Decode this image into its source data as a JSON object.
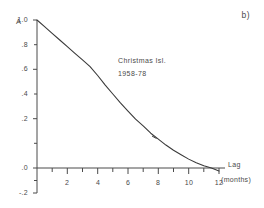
{
  "panel": {
    "label": "b)"
  },
  "annotation": {
    "line1": "Christmas Isl.",
    "line2": "1958-78"
  },
  "axes": {
    "y_symbol": "A",
    "x_title": "Lag",
    "x_units": "(months)",
    "y_ticks": [
      "1.0",
      ".8",
      ".6",
      ".4",
      ".2",
      ".0",
      "-.2"
    ],
    "x_ticks": [
      "2",
      "4",
      "6",
      "8",
      "10",
      "12"
    ]
  },
  "colors": {
    "ink": "#4a4a4a",
    "curve": "#3a3a3a",
    "background": "#ffffff"
  },
  "chart_data": {
    "type": "line",
    "title": "",
    "subtitle": "Christmas Isl. 1958-78",
    "xlabel": "Lag (months)",
    "ylabel": "A",
    "xlim": [
      0,
      12.6
    ],
    "ylim": [
      -0.2,
      1.0
    ],
    "grid": false,
    "legend": "none",
    "x": [
      0,
      0.5,
      1,
      1.5,
      2,
      2.5,
      3,
      3.5,
      4,
      4.5,
      5,
      5.5,
      6,
      6.5,
      7,
      7.5,
      8,
      8.5,
      9,
      9.5,
      10,
      10.5,
      11,
      11.5,
      12
    ],
    "series": [
      {
        "name": "Autocorrelation",
        "values": [
          1.0,
          0.955,
          0.91,
          0.865,
          0.82,
          0.775,
          0.73,
          0.685,
          0.625,
          0.56,
          0.5,
          0.44,
          0.385,
          0.33,
          0.285,
          0.235,
          0.195,
          0.155,
          0.12,
          0.09,
          0.06,
          0.035,
          0.015,
          0.0,
          -0.02
        ]
      }
    ],
    "y_ticks": [
      1.0,
      0.8,
      0.6,
      0.4,
      0.2,
      0.0,
      -0.2
    ],
    "y_tick_labels": [
      "1.0",
      ".8",
      ".6",
      ".4",
      ".2",
      ".0",
      "-.2"
    ],
    "x_ticks": [
      0,
      1,
      2,
      3,
      4,
      5,
      6,
      7,
      8,
      9,
      10,
      11,
      12
    ],
    "x_tick_labels": [
      "",
      "",
      "2",
      "",
      "4",
      "",
      "6",
      "",
      "8",
      "",
      "10",
      "",
      "12"
    ],
    "annotations": [
      {
        "text": "b)",
        "position": "top-right"
      },
      {
        "text": "Christmas Isl.",
        "position": "inside-upper-middle"
      },
      {
        "text": "1958-78",
        "position": "inside-upper-middle"
      }
    ],
    "zero_crossing_lag": 11.5
  }
}
